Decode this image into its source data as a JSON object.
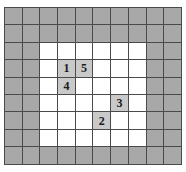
{
  "figure": {
    "name": "grid-puzzle",
    "columns": 10,
    "rows": 9,
    "colors": {
      "border_cell": "#a8a8a8",
      "inner_cell": "#ffffff",
      "marked_cell": "#c9c9c9",
      "gridline": "#4a4a4a",
      "text": "#1a1a1a",
      "page_background": "#ffffff"
    },
    "inner_region": {
      "col_start": 3,
      "col_end": 8,
      "row_start": 3,
      "row_end": 7
    },
    "labels": [
      {
        "value": "1",
        "col": 4,
        "row": 4
      },
      {
        "value": "5",
        "col": 5,
        "row": 4
      },
      {
        "value": "4",
        "col": 4,
        "row": 5
      },
      {
        "value": "3",
        "col": 7,
        "row": 6
      },
      {
        "value": "2",
        "col": 6,
        "row": 7
      }
    ],
    "cells": [
      [
        {
          "t": "border",
          "v": ""
        },
        {
          "t": "border",
          "v": ""
        },
        {
          "t": "border",
          "v": ""
        },
        {
          "t": "border",
          "v": ""
        },
        {
          "t": "border",
          "v": ""
        },
        {
          "t": "border",
          "v": ""
        },
        {
          "t": "border",
          "v": ""
        },
        {
          "t": "border",
          "v": ""
        },
        {
          "t": "border",
          "v": ""
        },
        {
          "t": "border",
          "v": ""
        }
      ],
      [
        {
          "t": "border",
          "v": ""
        },
        {
          "t": "border",
          "v": ""
        },
        {
          "t": "border",
          "v": ""
        },
        {
          "t": "border",
          "v": ""
        },
        {
          "t": "border",
          "v": ""
        },
        {
          "t": "border",
          "v": ""
        },
        {
          "t": "border",
          "v": ""
        },
        {
          "t": "border",
          "v": ""
        },
        {
          "t": "border",
          "v": ""
        },
        {
          "t": "border",
          "v": ""
        }
      ],
      [
        {
          "t": "border",
          "v": ""
        },
        {
          "t": "border",
          "v": ""
        },
        {
          "t": "inner",
          "v": ""
        },
        {
          "t": "inner",
          "v": ""
        },
        {
          "t": "inner",
          "v": ""
        },
        {
          "t": "inner",
          "v": ""
        },
        {
          "t": "inner",
          "v": ""
        },
        {
          "t": "inner",
          "v": ""
        },
        {
          "t": "border",
          "v": ""
        },
        {
          "t": "border",
          "v": ""
        }
      ],
      [
        {
          "t": "border",
          "v": ""
        },
        {
          "t": "border",
          "v": ""
        },
        {
          "t": "inner",
          "v": ""
        },
        {
          "t": "marked",
          "v": "1"
        },
        {
          "t": "marked",
          "v": "5"
        },
        {
          "t": "inner",
          "v": ""
        },
        {
          "t": "inner",
          "v": ""
        },
        {
          "t": "inner",
          "v": ""
        },
        {
          "t": "border",
          "v": ""
        },
        {
          "t": "border",
          "v": ""
        }
      ],
      [
        {
          "t": "border",
          "v": ""
        },
        {
          "t": "border",
          "v": ""
        },
        {
          "t": "inner",
          "v": ""
        },
        {
          "t": "marked",
          "v": "4"
        },
        {
          "t": "inner",
          "v": ""
        },
        {
          "t": "inner",
          "v": ""
        },
        {
          "t": "inner",
          "v": ""
        },
        {
          "t": "inner",
          "v": ""
        },
        {
          "t": "border",
          "v": ""
        },
        {
          "t": "border",
          "v": ""
        }
      ],
      [
        {
          "t": "border",
          "v": ""
        },
        {
          "t": "border",
          "v": ""
        },
        {
          "t": "inner",
          "v": ""
        },
        {
          "t": "inner",
          "v": ""
        },
        {
          "t": "inner",
          "v": ""
        },
        {
          "t": "inner",
          "v": ""
        },
        {
          "t": "marked",
          "v": "3"
        },
        {
          "t": "inner",
          "v": ""
        },
        {
          "t": "border",
          "v": ""
        },
        {
          "t": "border",
          "v": ""
        }
      ],
      [
        {
          "t": "border",
          "v": ""
        },
        {
          "t": "border",
          "v": ""
        },
        {
          "t": "inner",
          "v": ""
        },
        {
          "t": "inner",
          "v": ""
        },
        {
          "t": "inner",
          "v": ""
        },
        {
          "t": "marked",
          "v": "2"
        },
        {
          "t": "inner",
          "v": ""
        },
        {
          "t": "inner",
          "v": ""
        },
        {
          "t": "border",
          "v": ""
        },
        {
          "t": "border",
          "v": ""
        }
      ],
      [
        {
          "t": "border",
          "v": ""
        },
        {
          "t": "border",
          "v": ""
        },
        {
          "t": "inner",
          "v": ""
        },
        {
          "t": "inner",
          "v": ""
        },
        {
          "t": "inner",
          "v": ""
        },
        {
          "t": "inner",
          "v": ""
        },
        {
          "t": "inner",
          "v": ""
        },
        {
          "t": "inner",
          "v": ""
        },
        {
          "t": "border",
          "v": ""
        },
        {
          "t": "border",
          "v": ""
        }
      ],
      [
        {
          "t": "border",
          "v": ""
        },
        {
          "t": "border",
          "v": ""
        },
        {
          "t": "border",
          "v": ""
        },
        {
          "t": "border",
          "v": ""
        },
        {
          "t": "border",
          "v": ""
        },
        {
          "t": "border",
          "v": ""
        },
        {
          "t": "border",
          "v": ""
        },
        {
          "t": "border",
          "v": ""
        },
        {
          "t": "border",
          "v": ""
        },
        {
          "t": "border",
          "v": ""
        }
      ]
    ]
  }
}
